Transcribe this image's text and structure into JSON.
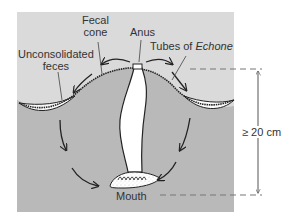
{
  "figure": {
    "colors": {
      "water": "#dadada",
      "sediment": "#b9b9b9",
      "worm": "#ffffff",
      "outline": "#222222",
      "text": "#333333"
    },
    "labels": {
      "fecal_cone_line1": "Fecal",
      "fecal_cone_line2": "cone",
      "anus": "Anus",
      "tubes_prefix": "Tubes of ",
      "tubes_genus": "Echone",
      "unconsolidated_line1": "Unconsolidated",
      "unconsolidated_line2": "feces",
      "mouth": "Mouth",
      "depth_scale": "≥ 20 cm"
    }
  }
}
